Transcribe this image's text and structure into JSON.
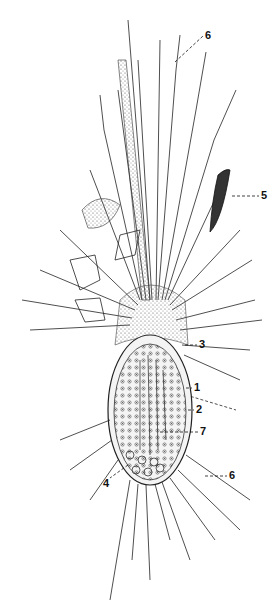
{
  "figure": {
    "colors": {
      "ink": "#1a1a1a",
      "stipple": "#8a8a8a",
      "background": "#ffffff"
    },
    "labels": [
      {
        "id": "6a",
        "text": "6",
        "x": 205,
        "y": 36
      },
      {
        "id": "5",
        "text": "5",
        "x": 261,
        "y": 192
      },
      {
        "id": "3",
        "text": "3",
        "x": 199,
        "y": 345
      },
      {
        "id": "1",
        "text": "1",
        "x": 194,
        "y": 388
      },
      {
        "id": "2",
        "text": "2",
        "x": 196,
        "y": 410
      },
      {
        "id": "7",
        "text": "7",
        "x": 200,
        "y": 432
      },
      {
        "id": "6b",
        "text": "6",
        "x": 229,
        "y": 472
      },
      {
        "id": "4",
        "text": "4",
        "x": 103,
        "y": 482
      }
    ]
  }
}
